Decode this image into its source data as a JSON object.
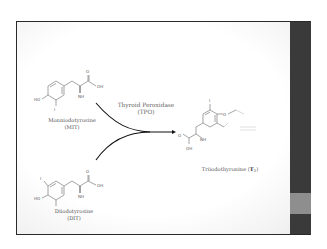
{
  "slide": {
    "colors": {
      "band": "#3a3a3a",
      "band_accent": "#8e8e8e",
      "frame": "#2a2a2a",
      "text": "#555555"
    }
  },
  "enzyme": {
    "name": "Thyroid Peroxidase",
    "abbr": "(TPO)"
  },
  "reactants": [
    {
      "name": "Monniodotyrosine",
      "abbr": "(MIT)",
      "atoms": {
        "ho": "HO",
        "oh": "OH",
        "o": "O",
        "nh2": "NH",
        "nh2_sub": "2",
        "i": "I"
      }
    },
    {
      "name": "Diiodotyrosine",
      "abbr": "(DIT)",
      "atoms": {
        "ho": "HO",
        "oh": "OH",
        "o": "O",
        "nh2": "NH",
        "nh2_sub": "2",
        "i1": "I",
        "i2": "I"
      }
    }
  ],
  "product": {
    "name": "Triiodothyronine (",
    "bold": "T",
    "sub": "3",
    "close": ")",
    "atoms": {
      "o": "O",
      "oh": "OH",
      "nh2": "NH",
      "nh2_sub": "2",
      "i": "I",
      "o_ether": "O",
      "oh2": "OH"
    }
  }
}
